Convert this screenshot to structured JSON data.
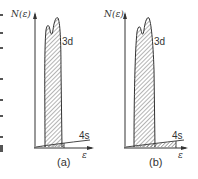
{
  "figure": {
    "panels": [
      {
        "id": "a",
        "caption": "(a)",
        "y_axis_label": "N(ε)",
        "x_axis_label": "ε",
        "band_3d_label": "3d",
        "band_4s_label": "4s"
      },
      {
        "id": "b",
        "caption": "(b)",
        "y_axis_label": "N(ε)",
        "x_axis_label": "ε",
        "band_3d_label": "3d",
        "band_4s_label": "4s"
      }
    ],
    "colors": {
      "line": "#333333",
      "hatch": "#444444",
      "background": "#ffffff"
    }
  }
}
